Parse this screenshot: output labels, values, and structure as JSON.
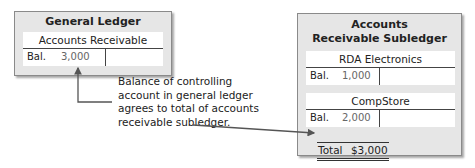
{
  "general_ledger": {
    "title": "General Ledger",
    "account": {
      "name": "Accounts Receivable",
      "label": "Bal.",
      "value": "3,000"
    }
  },
  "subledger": {
    "title_line1": "Accounts",
    "title_line2": "Receivable Subledger",
    "accounts": [
      {
        "name": "RDA Electronics",
        "label": "Bal.",
        "value": "1,000"
      },
      {
        "name": "CompStore",
        "label": "Bal.",
        "value": "2,000"
      }
    ],
    "total_label": "Total",
    "total_value": "$3,000"
  },
  "annotation": {
    "lines": [
      "Balance of controlling",
      "account in general ledger",
      "agrees to total of accounts",
      "receivable subledger."
    ]
  },
  "colors": {
    "panel_bg": "#e6e6e6",
    "arrow": "#555555"
  }
}
